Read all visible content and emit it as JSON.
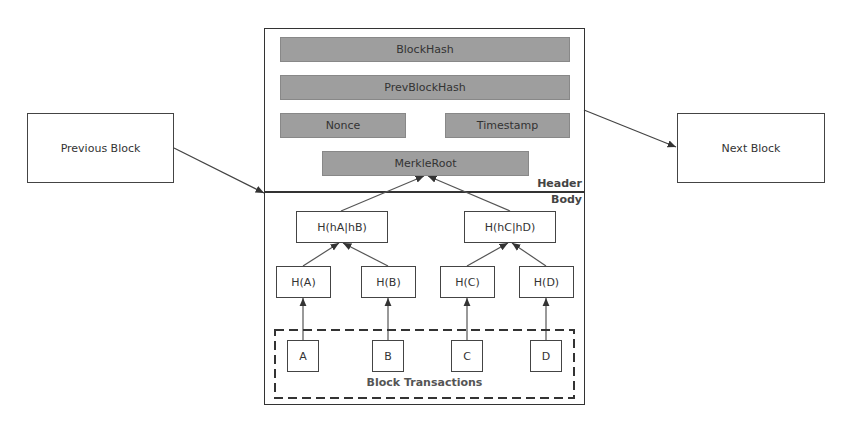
{
  "diagram": {
    "outer_blocks": {
      "previous": "Previous Block",
      "next": "Next Block"
    },
    "header": {
      "section_label": "Header",
      "fields": {
        "block_hash": "BlockHash",
        "prev_block_hash": "PrevBlockHash",
        "nonce": "Nonce",
        "timestamp": "Timestamp",
        "merkle_root": "MerkleRoot"
      }
    },
    "body": {
      "section_label": "Body",
      "level2": [
        "H(hA|hB)",
        "H(hC|hD)"
      ],
      "level1": [
        "H(A)",
        "H(B)",
        "H(C)",
        "H(D)"
      ],
      "transactions": [
        "A",
        "B",
        "C",
        "D"
      ],
      "transactions_label": "Block Transactions"
    },
    "colors": {
      "field_fill": "#9e9e9e",
      "line": "#444444",
      "background": "#ffffff"
    }
  }
}
